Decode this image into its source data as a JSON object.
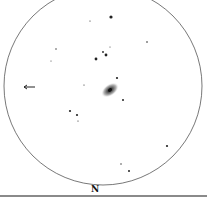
{
  "sketch": {
    "type": "eyepiece-field-sketch",
    "orientation_label": "N",
    "field_circle": {
      "cx": 103,
      "cy": 86,
      "r": 99,
      "stroke": "#555555"
    },
    "galaxy": {
      "cx": 110,
      "cy": 90,
      "rx": 10,
      "ry": 6,
      "rotation": -35
    },
    "arrow": {
      "x1": 24,
      "y1": 87,
      "x2": 35,
      "y2": 87
    },
    "stars": [
      {
        "x": 111,
        "y": 17,
        "r": 1.6
      },
      {
        "x": 90,
        "y": 21,
        "r": 0.6
      },
      {
        "x": 147,
        "y": 42,
        "r": 0.8
      },
      {
        "x": 56,
        "y": 49,
        "r": 0.7
      },
      {
        "x": 51,
        "y": 61,
        "r": 0.5
      },
      {
        "x": 110,
        "y": 47,
        "r": 0.5
      },
      {
        "x": 103,
        "y": 52,
        "r": 0.9
      },
      {
        "x": 106,
        "y": 55,
        "r": 1.4
      },
      {
        "x": 96,
        "y": 59,
        "r": 1.4
      },
      {
        "x": 117,
        "y": 78,
        "r": 1.1
      },
      {
        "x": 84,
        "y": 85,
        "r": 0.6
      },
      {
        "x": 123,
        "y": 100,
        "r": 1.0
      },
      {
        "x": 70,
        "y": 111,
        "r": 1.1
      },
      {
        "x": 77,
        "y": 115,
        "r": 1.1
      },
      {
        "x": 78,
        "y": 121,
        "r": 0.6
      },
      {
        "x": 167,
        "y": 146,
        "r": 1.1
      },
      {
        "x": 121,
        "y": 164,
        "r": 0.7
      },
      {
        "x": 129,
        "y": 171,
        "r": 1.0
      }
    ]
  }
}
